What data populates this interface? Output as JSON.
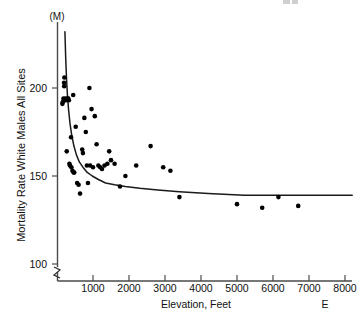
{
  "chart_data": {
    "type": "scatter",
    "title": "",
    "xlabel": "Elevation, Feet",
    "ylabel": "Mortality Rate White Males All Sites",
    "yunit": "(M)",
    "xlim": [
      0,
      8300
    ],
    "ylim": [
      95,
      232
    ],
    "y_axis_break": true,
    "y_break_label": "axis-break",
    "grid": false,
    "legend": null,
    "xticks": [
      1000,
      2000,
      3000,
      4000,
      5000,
      6000,
      7000,
      8000
    ],
    "xtick_labels": [
      "1000",
      "2000",
      "3000",
      "4000",
      "5000",
      "6000",
      "7000",
      "8000"
    ],
    "yticks": [
      100,
      150,
      200
    ],
    "ytick_labels": [
      "100",
      "150",
      "200"
    ],
    "corner_label": "E",
    "points": [
      [
        150,
        191
      ],
      [
        160,
        192
      ],
      [
        180,
        194
      ],
      [
        195,
        203
      ],
      [
        200,
        201
      ],
      [
        205,
        206
      ],
      [
        215,
        193
      ],
      [
        240,
        194
      ],
      [
        250,
        193
      ],
      [
        270,
        164
      ],
      [
        300,
        194
      ],
      [
        310,
        194
      ],
      [
        330,
        193
      ],
      [
        345,
        157
      ],
      [
        360,
        156
      ],
      [
        390,
        172
      ],
      [
        400,
        155
      ],
      [
        430,
        153
      ],
      [
        450,
        196
      ],
      [
        460,
        152
      ],
      [
        480,
        152
      ],
      [
        520,
        178
      ],
      [
        560,
        146
      ],
      [
        600,
        145
      ],
      [
        640,
        140
      ],
      [
        700,
        165
      ],
      [
        720,
        163
      ],
      [
        760,
        183
      ],
      [
        800,
        175
      ],
      [
        830,
        156
      ],
      [
        860,
        146
      ],
      [
        900,
        200
      ],
      [
        920,
        156
      ],
      [
        960,
        188
      ],
      [
        1000,
        155
      ],
      [
        1050,
        184
      ],
      [
        1100,
        168
      ],
      [
        1150,
        156
      ],
      [
        1200,
        155
      ],
      [
        1250,
        154
      ],
      [
        1320,
        156
      ],
      [
        1400,
        157
      ],
      [
        1450,
        164
      ],
      [
        1500,
        159
      ],
      [
        1600,
        157
      ],
      [
        1750,
        144
      ],
      [
        1900,
        150
      ],
      [
        2200,
        156
      ],
      [
        2600,
        167
      ],
      [
        2950,
        155
      ],
      [
        3150,
        153
      ],
      [
        3400,
        138
      ],
      [
        5000,
        134
      ],
      [
        5700,
        132
      ],
      [
        6150,
        138
      ],
      [
        6700,
        133
      ]
    ],
    "fit_curve": {
      "description": "decreasing-power-fit",
      "points": [
        [
          220,
          232
        ],
        [
          240,
          218
        ],
        [
          265,
          205
        ],
        [
          290,
          196
        ],
        [
          320,
          188
        ],
        [
          360,
          180
        ],
        [
          410,
          173
        ],
        [
          470,
          167
        ],
        [
          540,
          162
        ],
        [
          620,
          158
        ],
        [
          720,
          155
        ],
        [
          840,
          152
        ],
        [
          980,
          150
        ],
        [
          1150,
          148
        ],
        [
          1350,
          146
        ],
        [
          1600,
          145
        ],
        [
          1900,
          144
        ],
        [
          2300,
          143
        ],
        [
          2800,
          142
        ],
        [
          3400,
          141
        ],
        [
          4200,
          140
        ],
        [
          5200,
          139
        ],
        [
          6400,
          139
        ],
        [
          7400,
          139
        ],
        [
          8200,
          139
        ]
      ]
    }
  }
}
